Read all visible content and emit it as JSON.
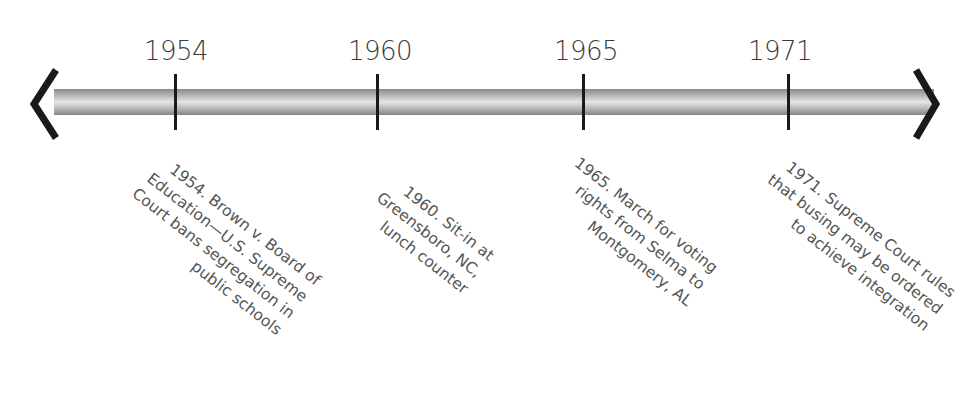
{
  "timeline": {
    "events": [
      {
        "year": "1954",
        "x": 175,
        "text": "1954. Brown v. Board of Education—U.S. Supreme Court bans segregation in public schools"
      },
      {
        "year": "1960",
        "x": 377,
        "text": "1960. Sit-in at Greensboro, NC, lunch counter"
      },
      {
        "year": "1965",
        "x": 583,
        "text": "1965. March for voting rights from Selma to Montgomery, AL"
      },
      {
        "year": "1971",
        "x": 788,
        "text": "1971. Supreme Court rules that busing may be ordered to achieve integration"
      }
    ],
    "colors": {
      "tick": "#1a1a1a",
      "bar_dark": "#858585",
      "bar_light": "#e6e6e6",
      "text": "#555555"
    }
  }
}
